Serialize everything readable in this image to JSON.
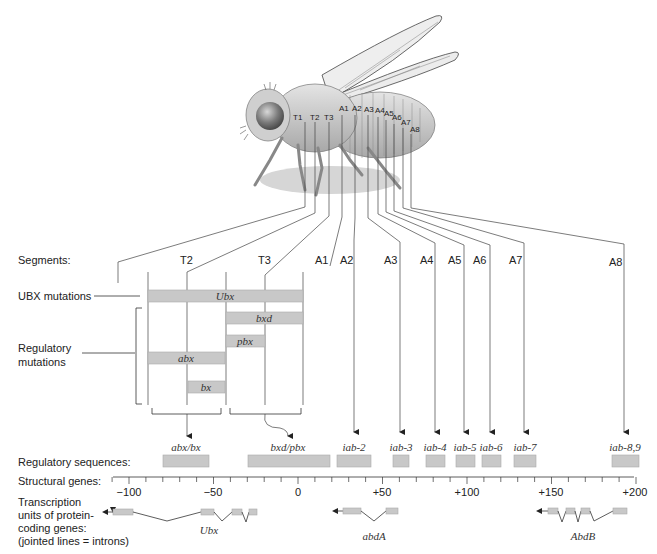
{
  "caption_fragment": "…",
  "fly": {
    "segment_labels": [
      "T1",
      "T2",
      "T3",
      "A1",
      "A2",
      "A3",
      "A4",
      "A5",
      "A6",
      "A7",
      "A8"
    ]
  },
  "rows": {
    "segments_label": "Segments:",
    "ubx_label": "UBX mutations",
    "regulatory_label_line1": "Regulatory",
    "regulatory_label_line2": "mutations",
    "regulatory_sequences_label": "Regulatory sequences:",
    "structural_genes_label": "Structural genes:",
    "transcription_line1": "Transcription",
    "transcription_line2": "units of protein-",
    "transcription_line3": "coding genes:",
    "transcription_line4": "(jointed lines = introns)"
  },
  "segments": [
    {
      "label": "T2"
    },
    {
      "label": "T3"
    },
    {
      "label": "A1"
    },
    {
      "label": "A2"
    },
    {
      "label": "A3"
    },
    {
      "label": "A4"
    },
    {
      "label": "A5"
    },
    {
      "label": "A6"
    },
    {
      "label": "A7"
    },
    {
      "label": "A8"
    }
  ],
  "mutations": [
    {
      "label": "Ubx"
    },
    {
      "label": "bxd"
    },
    {
      "label": "pbx"
    },
    {
      "label": "abx"
    },
    {
      "label": "bx"
    }
  ],
  "regulatory_sequences": [
    {
      "label": "abx/bx"
    },
    {
      "label": "bxd/pbx"
    },
    {
      "label": "iab-2"
    },
    {
      "label": "iab-3"
    },
    {
      "label": "iab-4"
    },
    {
      "label": "iab-5"
    },
    {
      "label": "iab-6"
    },
    {
      "label": "iab-7"
    },
    {
      "label": "iab-8,9"
    }
  ],
  "axis": {
    "ticks": [
      "−100",
      "−50",
      "0",
      "+50",
      "+100",
      "+150",
      "+200"
    ]
  },
  "genes": [
    {
      "label": "Ubx"
    },
    {
      "label": "abdA"
    },
    {
      "label": "AbdB"
    }
  ],
  "colors": {
    "bar_fill": "#c8c8c8",
    "line": "#333333",
    "fly_body": "#bdbdbd"
  }
}
